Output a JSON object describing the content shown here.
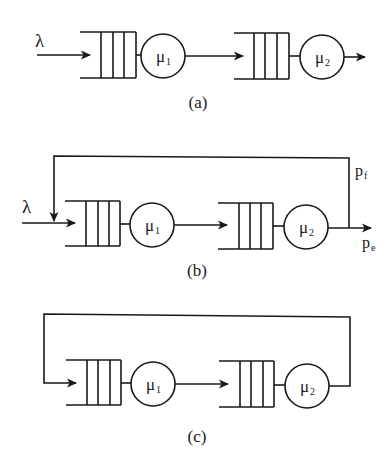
{
  "figure": {
    "background": "#ffffff",
    "stroke_color": "#1a1a1a",
    "panels": [
      {
        "id": "a",
        "caption": "(a)",
        "input_label": "λ",
        "servers": [
          {
            "symbol": "μ",
            "subscript": "1"
          },
          {
            "symbol": "μ",
            "subscript": "2"
          }
        ],
        "feedback": "none"
      },
      {
        "id": "b",
        "caption": "(b)",
        "input_label": "λ",
        "servers": [
          {
            "symbol": "μ",
            "subscript": "1"
          },
          {
            "symbol": "μ",
            "subscript": "2"
          }
        ],
        "feedback": "probabilistic",
        "feedback_label": {
          "symbol": "p",
          "subscript": "f"
        },
        "exit_label": {
          "symbol": "p",
          "subscript": "e"
        }
      },
      {
        "id": "c",
        "caption": "(c)",
        "servers": [
          {
            "symbol": "μ",
            "subscript": "1"
          },
          {
            "symbol": "μ",
            "subscript": "2"
          }
        ],
        "feedback": "closed-loop"
      }
    ]
  }
}
